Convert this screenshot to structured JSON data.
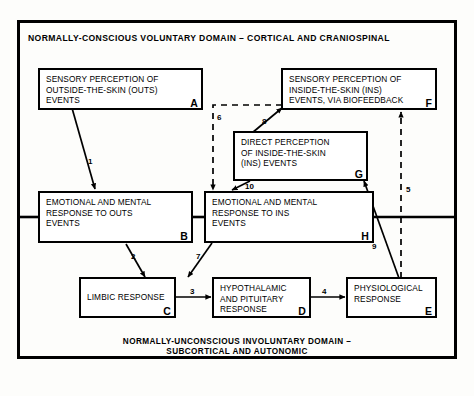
{
  "figure": {
    "top_domain_label": "NORMALLY-CONSCIOUS VOLUNTARY DOMAIN – CORTICAL AND CRANIOSPINAL",
    "bottom_domain_label": "NORMALLY-UNCONSCIOUS INVOLUNTARY DOMAIN –\nSUBCORTICAL AND AUTONOMIC",
    "ink_color": "#000000",
    "background_color": "#ffffff"
  },
  "nodes": [
    {
      "key": "A",
      "text": "SENSORY PERCEPTION OF\nOUTSIDE-THE-SKIN (OUTS)\nEVENTS"
    },
    {
      "key": "F",
      "text": "SENSORY PERCEPTION OF\nINSIDE-THE-SKIN (INS)\nEVENTS, VIA BIOFEEDBACK"
    },
    {
      "key": "G",
      "text": "DIRECT PERCEPTION\nOF INSIDE-THE-SKIN\n(INS) EVENTS"
    },
    {
      "key": "B",
      "text": "EMOTIONAL AND MENTAL\nRESPONSE TO OUTS\nEVENTS"
    },
    {
      "key": "H",
      "text": "EMOTIONAL AND MENTAL\nRESPONSE TO INS\nEVENTS"
    },
    {
      "key": "C",
      "text": "LIMBIC RESPONSE"
    },
    {
      "key": "D",
      "text": "HYPOTHALAMIC\nAND PITUITARY\nRESPONSE"
    },
    {
      "key": "E",
      "text": "PHYSIOLOGICAL\nRESPONSE"
    }
  ],
  "edges": [
    {
      "label": "1",
      "from": "A",
      "to": "B",
      "style": "solid"
    },
    {
      "label": "2",
      "from": "B",
      "to": "C",
      "style": "solid"
    },
    {
      "label": "3",
      "from": "C",
      "to": "D",
      "style": "solid"
    },
    {
      "label": "4",
      "from": "D",
      "to": "E",
      "style": "solid"
    },
    {
      "label": "5",
      "from": "E",
      "to": "F",
      "style": "dashed"
    },
    {
      "label": "6",
      "from": "F",
      "to": "H",
      "style": "dashed"
    },
    {
      "label": "7",
      "from": "H",
      "to": "C",
      "style": "solid"
    },
    {
      "label": "8",
      "from": "G",
      "to": "F",
      "style": "solid"
    },
    {
      "label": "9",
      "from": "E",
      "to": "G",
      "style": "solid"
    },
    {
      "label": "10",
      "from": "G",
      "to": "H",
      "style": "solid"
    }
  ]
}
